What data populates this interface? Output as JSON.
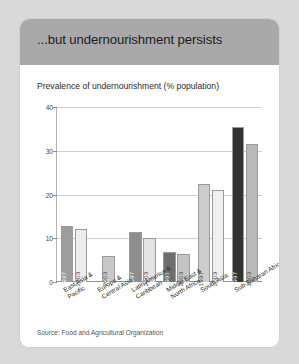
{
  "figure": {
    "title": "...but undernourishment persists",
    "subtitle": "Prevalence of undernourishment (% population)",
    "source": "Source: Food and Agricultural Organization",
    "colors": {
      "page_background": "#d9d9d9",
      "panel_background": "#ffffff",
      "header_band": "#a9a9a9",
      "gridline": "#cfcfcf",
      "axis": "#8f8f8f"
    }
  },
  "chart_data": {
    "type": "bar",
    "title": "...but undernourishment persists",
    "subtitle": "Prevalence of undernourishment (% population)",
    "xlabel": "",
    "ylabel": "",
    "ylim": [
      0,
      40
    ],
    "yticks": [
      0,
      10,
      20,
      30,
      40
    ],
    "ytick_labels": [
      "0",
      "10",
      "20",
      "30",
      "40"
    ],
    "grid": true,
    "legend": "none",
    "categories": [
      "East Asia &\nPacific",
      "Europe &\nCentral Asia",
      "Latin America &\nCaribbean",
      "Middle East &\nNorth Africa",
      "South Asia",
      "Sub-Saharan Africa"
    ],
    "series": [
      {
        "name": "1997",
        "values": [
          12.8,
          null,
          11.5,
          6.8,
          22.5,
          35.5
        ],
        "color": "#8f8f8f"
      },
      {
        "name": "2003",
        "values": [
          12.2,
          6.0,
          10.0,
          6.3,
          21.0,
          31.5
        ],
        "color": "#d6d6d6"
      }
    ],
    "bars": [
      {
        "region": "East Asia & Pacific",
        "year": "1997",
        "value": 12.8,
        "color": "#9d9d9d",
        "label_on_dark": true
      },
      {
        "region": "East Asia & Pacific",
        "year": "2003",
        "value": 12.2,
        "color": "#ededed",
        "label_on_dark": false
      },
      {
        "region": "Europe & Central Asia",
        "year": "2003",
        "value": 6.0,
        "color": "#c8c8c8",
        "label_on_dark": false
      },
      {
        "region": "Latin America & Caribbean",
        "year": "1997",
        "value": 11.5,
        "color": "#8d8d8d",
        "label_on_dark": true
      },
      {
        "region": "Latin America & Caribbean",
        "year": "2003",
        "value": 10.0,
        "color": "#e3e3e3",
        "label_on_dark": false
      },
      {
        "region": "Middle East & North Africa",
        "year": "1997",
        "value": 6.8,
        "color": "#6e6e6e",
        "label_on_dark": true
      },
      {
        "region": "Middle East & North Africa",
        "year": "2003",
        "value": 6.3,
        "color": "#c4c4c4",
        "label_on_dark": false
      },
      {
        "region": "South Asia",
        "year": "1997",
        "value": 22.5,
        "color": "#cdcdcd",
        "label_on_dark": false
      },
      {
        "region": "South Asia",
        "year": "2003",
        "value": 21.0,
        "color": "#f0f0f0",
        "label_on_dark": false
      },
      {
        "region": "Sub-Saharan Africa",
        "year": "1997",
        "value": 35.5,
        "color": "#333333",
        "label_on_dark": true
      },
      {
        "region": "Sub-Saharan Africa",
        "year": "2003",
        "value": 31.5,
        "color": "#b9b9b9",
        "label_on_dark": false
      }
    ],
    "region_labels": [
      {
        "line1": "East Asia &",
        "line2": "Pacific"
      },
      {
        "line1": "Europe &",
        "line2": "Central Asia"
      },
      {
        "line1": "Latin America &",
        "line2": "Caribbean"
      },
      {
        "line1": "Middle East &",
        "line2": "North Africa"
      },
      {
        "line1": "South Asia",
        "line2": ""
      },
      {
        "line1": "Sub-Saharan Africa",
        "line2": ""
      }
    ]
  }
}
